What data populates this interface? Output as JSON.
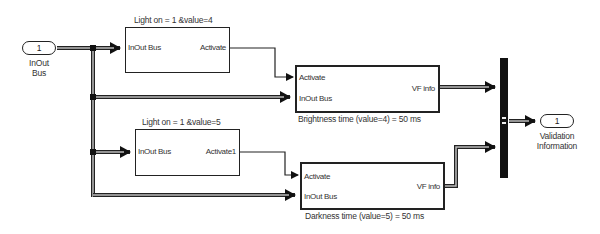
{
  "diagram": {
    "inport": {
      "number": "1",
      "label_line1": "InOut",
      "label_line2": "Bus"
    },
    "outport": {
      "number": "1",
      "label_line1": "Validation",
      "label_line2": "Information"
    },
    "blocks": [
      {
        "title": "Light on = 1  &value=4",
        "in_port": "InOut Bus",
        "out_port": "Activate"
      },
      {
        "caption": "Brightness time (value=4) = 50 ms",
        "in_port_1": "Activate",
        "in_port_2": "InOut Bus",
        "out_port": "VF info"
      },
      {
        "title": "Light on = 1   &value=5",
        "in_port": "InOut Bus",
        "out_port": "Activate1"
      },
      {
        "caption": "Darkness time (value=5) = 50 ms",
        "in_port_1": "Activate",
        "in_port_2": "InOut Bus",
        "out_port": "VF info"
      }
    ],
    "colors": {
      "line": "#222222",
      "bus_fill": "#bbbbbb",
      "mux": "#111111"
    }
  }
}
